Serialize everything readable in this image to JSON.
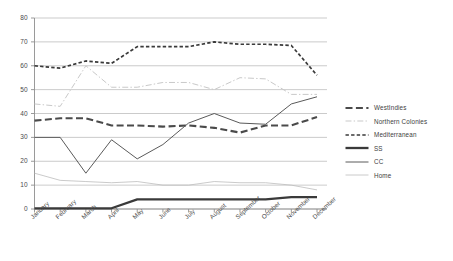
{
  "chart_data": {
    "type": "line",
    "title": "",
    "xlabel": "",
    "ylabel": "",
    "ylim": [
      0,
      80
    ],
    "ytick_step": 10,
    "yticks": [
      "0",
      "10",
      "20",
      "30",
      "40",
      "50",
      "60",
      "70",
      "80"
    ],
    "grid": true,
    "legend_position": "right",
    "categories": [
      "January",
      "February",
      "March",
      "April",
      "May",
      "June",
      "July",
      "August",
      "September",
      "October",
      "November",
      "December"
    ],
    "series": [
      {
        "name": "WestIndies",
        "style": "dashed-medium",
        "color": "#4a4a4a",
        "values": [
          37,
          38,
          38,
          35,
          35,
          34.5,
          35,
          34,
          32,
          35,
          35,
          38.5
        ]
      },
      {
        "name": "Northern Colonies",
        "style": "solid-light",
        "color": "#c9c9c9",
        "values": [
          44,
          43,
          60,
          51,
          51,
          53,
          53,
          50,
          55,
          54.5,
          48,
          48
        ]
      },
      {
        "name": "Mediterranean",
        "style": "dashed-short",
        "color": "#3a3a3a",
        "values": [
          60,
          59,
          62,
          61,
          68,
          68,
          68,
          70,
          69,
          69,
          68.5,
          56
        ]
      },
      {
        "name": "SS",
        "style": "solid-thick",
        "color": "#3a3a3a",
        "values": [
          0.3,
          0.3,
          0.3,
          0.3,
          4,
          4,
          4,
          4,
          4,
          4,
          5,
          5
        ]
      },
      {
        "name": "CC",
        "style": "solid-thin",
        "color": "#5a5a5a",
        "values": [
          30,
          30,
          15,
          29,
          21,
          27,
          36,
          40,
          36,
          35.5,
          44,
          47
        ]
      },
      {
        "name": "Home",
        "style": "solid-hairline",
        "color": "#bdbdbd",
        "values": [
          15,
          12,
          11.5,
          11,
          11.5,
          10,
          10,
          11.5,
          11,
          11,
          10,
          8
        ]
      }
    ],
    "dashdot_series": "Northern Colonies"
  },
  "legend": {
    "items": [
      {
        "label": "WestIndies",
        "swatch": "dashed-medium-swatch"
      },
      {
        "label": "Northern Colonies",
        "swatch": "solid-light-swatch"
      },
      {
        "label": "Mediterranean",
        "swatch": "dashed-short-swatch"
      },
      {
        "label": "SS",
        "swatch": "solid-thick-swatch"
      },
      {
        "label": "CC",
        "swatch": "solid-thin-swatch"
      },
      {
        "label": "Home",
        "swatch": "solid-hairline-swatch"
      }
    ]
  }
}
